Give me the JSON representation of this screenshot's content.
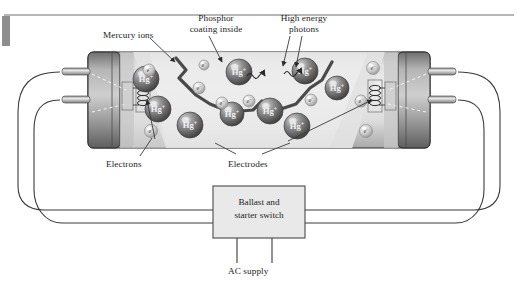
{
  "figure": {
    "title_bar": {
      "rule_color": "#6f6f6f",
      "tab_color": "#8a8a8a"
    },
    "callouts": [
      {
        "id": "mercury-ions",
        "text": "Mercury ions",
        "x": 103,
        "y": 31,
        "align": "left"
      },
      {
        "id": "phosphor-coating",
        "line1": "Phosphor",
        "line2": "coating inside",
        "x": 176,
        "y": 14,
        "align": "center"
      },
      {
        "id": "high-energy-photons",
        "line1": "High energy",
        "line2": "photons",
        "x": 273,
        "y": 14,
        "align": "center"
      },
      {
        "id": "electrons",
        "text": "Electrons",
        "x": 106,
        "y": 160,
        "align": "left"
      },
      {
        "id": "electrodes",
        "text": "Electrodes",
        "x": 228,
        "y": 160,
        "align": "left"
      },
      {
        "id": "ac-supply",
        "text": "AC supply",
        "x": 232,
        "y": 268,
        "align": "left"
      }
    ],
    "ballast_box": {
      "line1": "Ballast and",
      "line2": "starter switch",
      "x": 213,
      "y": 186,
      "w": 92,
      "h": 52,
      "fill": "#e9e9e9",
      "stroke": "#4a4a4a"
    },
    "tube": {
      "x": 88,
      "y": 52,
      "w": 342,
      "h": 96,
      "glass_fill": "#e3e3e3",
      "cap_fill": "#9a9a9a",
      "outline": "#2b2b2b"
    },
    "particles": {
      "ion_label": "Hg",
      "ion_charge": "+",
      "electron_label": "e",
      "electron_charge": "–",
      "ion_color_light": "#c9c9c9",
      "ion_color_dark": "#5c5c5c",
      "electron_color_light": "#e6e6e6",
      "electron_color_dark": "#9b9b9b",
      "ions": [
        {
          "cx": 146,
          "cy": 79,
          "r": 13
        },
        {
          "cx": 239,
          "cy": 72,
          "r": 13
        },
        {
          "cx": 305,
          "cy": 71,
          "r": 13
        },
        {
          "cx": 337,
          "cy": 88,
          "r": 12
        },
        {
          "cx": 158,
          "cy": 109,
          "r": 13
        },
        {
          "cx": 270,
          "cy": 111,
          "r": 13
        },
        {
          "cx": 190,
          "cy": 125,
          "r": 13
        },
        {
          "cx": 297,
          "cy": 126,
          "r": 13
        },
        {
          "cx": 232,
          "cy": 114,
          "r": 12
        }
      ],
      "electrons": [
        {
          "cx": 149,
          "cy": 70,
          "r": 6
        },
        {
          "cx": 199,
          "cy": 88,
          "r": 6
        },
        {
          "cx": 222,
          "cy": 103,
          "r": 6
        },
        {
          "cx": 249,
          "cy": 101,
          "r": 6
        },
        {
          "cx": 311,
          "cy": 100,
          "r": 6
        },
        {
          "cx": 361,
          "cy": 101,
          "r": 6
        },
        {
          "cx": 151,
          "cy": 131,
          "r": 6.5
        },
        {
          "cx": 373,
          "cy": 68,
          "r": 6.5
        },
        {
          "cx": 366,
          "cy": 131,
          "r": 6.5
        },
        {
          "cx": 204,
          "cy": 65,
          "r": 5
        }
      ]
    },
    "electrodes": [
      {
        "id": "left-electrode",
        "x": 126,
        "y": 84,
        "w": 14,
        "h": 26
      },
      {
        "id": "right-electrode",
        "x": 372,
        "y": 84,
        "w": 14,
        "h": 26
      }
    ],
    "phosphor_zigzag": "M 176,58 L 186,70 L 179,78 L 196,95 L 210,104 L 230,112 L 253,110 L 262,101 L 272,112 L 296,104 L 310,88 L 322,80 L 332,62",
    "photons": [
      {
        "id": "photon-left",
        "path": "M 247,76 q 3,-5 6,0 q 3,5 6,0 q 3,-5 6,0"
      },
      {
        "id": "photon-right",
        "path": "M 284,74 q 3,-5 6,0 q 3,5 6,0 q 3,-5 6,0"
      }
    ],
    "wires": {
      "stroke": "#3a3a3a",
      "width": 1.1
    }
  }
}
